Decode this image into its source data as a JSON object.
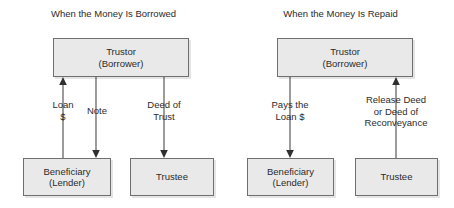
{
  "figure": {
    "type": "flow-diagram"
  },
  "panels": [
    {
      "id": "borrowed",
      "title": "When the Money Is Borrowed",
      "nodes": {
        "trustor": {
          "line1": "Trustor",
          "line2": "(Borrower)"
        },
        "beneficiary": {
          "line1": "Beneficiary",
          "line2": "(Lender)"
        },
        "trustee": {
          "line1": "Trustee",
          "line2": ""
        }
      },
      "edges": [
        {
          "id": "loan",
          "line1": "Loan",
          "line2": "$",
          "line3": "",
          "from": "beneficiary",
          "to": "trustor",
          "direction": "up"
        },
        {
          "id": "note",
          "line1": "Note",
          "line2": "",
          "line3": "",
          "from": "trustor",
          "to": "beneficiary",
          "direction": "down"
        },
        {
          "id": "deed-of-trust",
          "line1": "Deed of",
          "line2": "Trust",
          "line3": "",
          "from": "trustor",
          "to": "trustee",
          "direction": "down"
        }
      ]
    },
    {
      "id": "repaid",
      "title": "When the Money Is Repaid",
      "nodes": {
        "trustor": {
          "line1": "Trustor",
          "line2": "(Borrower)"
        },
        "beneficiary": {
          "line1": "Beneficiary",
          "line2": "(Lender)"
        },
        "trustee": {
          "line1": "Trustee",
          "line2": ""
        }
      },
      "edges": [
        {
          "id": "pays-loan",
          "line1": "Pays the",
          "line2": "Loan $",
          "line3": "",
          "from": "trustor",
          "to": "beneficiary",
          "direction": "down"
        },
        {
          "id": "release-deed",
          "line1": "Release Deed",
          "line2": "or Deed of",
          "line3": "Reconveyance",
          "from": "trustee",
          "to": "trustor",
          "direction": "up"
        }
      ]
    }
  ],
  "colors": {
    "box_fill": "#e9e9e9",
    "box_border": "#6f6f6f",
    "text": "#2b2b2b",
    "line": "#4a4a4a",
    "background": "#ffffff"
  }
}
